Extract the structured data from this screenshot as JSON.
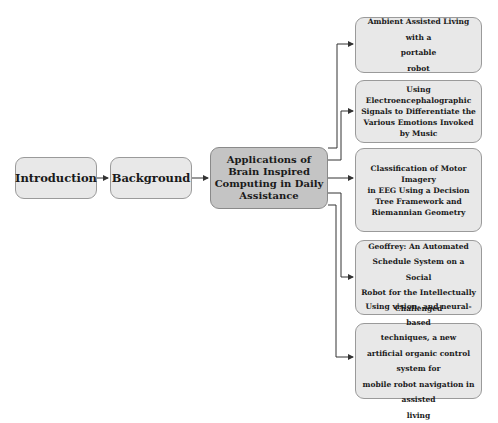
{
  "diagram": {
    "flow": [
      {
        "id": "intro",
        "label": "Introduction"
      },
      {
        "id": "background",
        "label": "Background"
      }
    ],
    "center": {
      "lines": [
        "Applications of",
        "Brain Inspired",
        "Computing in Daily",
        "Assistance"
      ]
    },
    "branches": [
      {
        "lines": [
          "Ambient Assisted Living with a",
          "portable",
          "robot"
        ]
      },
      {
        "lines": [
          "Using",
          "Electroencephalographic",
          "Signals to Differentiate the",
          "Various Emotions Invoked",
          "by Music"
        ]
      },
      {
        "lines": [
          "Classification of Motor",
          "Imagery",
          "in EEG Using a Decision",
          "Tree Framework and",
          "Riemannian Geometry"
        ]
      },
      {
        "lines": [
          "Geoffrey: An Automated",
          "Schedule System on a Social",
          "Robot for the Intellectually",
          "Challenged"
        ]
      },
      {
        "lines": [
          "Using vision- and neural-based",
          "techniques, a new",
          "artificial organic control system for",
          "mobile robot navigation in assisted",
          "living"
        ]
      }
    ],
    "colors": {
      "box_fill": "#e8e8e8",
      "center_fill": "#c4c4c4",
      "border": "#9a9a9a",
      "arrow": "#333333"
    }
  }
}
